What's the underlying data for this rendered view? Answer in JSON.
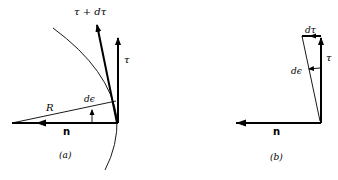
{
  "panel_a": {
    "caption": "(a)",
    "labels": {
      "tau_plus_dtau": "τ + dτ",
      "tau": "τ",
      "radius": "R",
      "d_epsilon": "dϵ",
      "normal": "n"
    }
  },
  "panel_b": {
    "caption": "(b)",
    "labels": {
      "dtau": "dτ",
      "tau": "τ",
      "d_epsilon": "dϵ",
      "normal": "n"
    }
  },
  "colors": {
    "stroke": "#000000",
    "background": "#ffffff"
  }
}
